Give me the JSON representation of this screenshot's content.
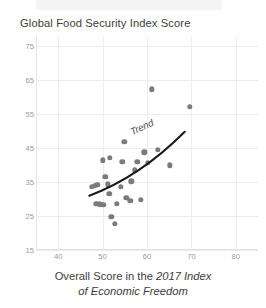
{
  "chart_data": {
    "type": "scatter",
    "title": "Global Food Security Index Score",
    "xlabel_plain": "Overall Score in the ",
    "xlabel_italic_line1": "2017 Index",
    "xlabel_italic_line2": "of Economic Freedom",
    "ylabel": "Global Food Security Index Score",
    "xlim": [
      35,
      85
    ],
    "ylim": [
      15,
      78
    ],
    "xticks": [
      40,
      50,
      60,
      70,
      80
    ],
    "yticks": [
      15,
      25,
      35,
      45,
      55,
      65,
      75
    ],
    "grid": "light",
    "legend": "none",
    "annotations": [
      {
        "text": "Trend",
        "style": "italic",
        "rotation_deg": -25
      }
    ],
    "series": [
      {
        "name": "Countries",
        "marker": "circle",
        "color": "#7b7b7b",
        "points": [
          {
            "x": 47.6,
            "y": 33.6
          },
          {
            "x": 48.3,
            "y": 33.9
          },
          {
            "x": 48.8,
            "y": 34.2
          },
          {
            "x": 48.6,
            "y": 28.6
          },
          {
            "x": 49.4,
            "y": 28.4
          },
          {
            "x": 50.2,
            "y": 28.3
          },
          {
            "x": 50.0,
            "y": 41.4
          },
          {
            "x": 50.6,
            "y": 36.5
          },
          {
            "x": 51.2,
            "y": 34.3
          },
          {
            "x": 51.6,
            "y": 42.2
          },
          {
            "x": 51.5,
            "y": 31.5
          },
          {
            "x": 52.0,
            "y": 24.7
          },
          {
            "x": 52.8,
            "y": 22.8
          },
          {
            "x": 53.2,
            "y": 28.6
          },
          {
            "x": 54.1,
            "y": 33.6
          },
          {
            "x": 54.4,
            "y": 40.9
          },
          {
            "x": 54.9,
            "y": 46.8
          },
          {
            "x": 55.3,
            "y": 30.4
          },
          {
            "x": 56.2,
            "y": 29.5
          },
          {
            "x": 56.5,
            "y": 35.2
          },
          {
            "x": 57.3,
            "y": 38.5
          },
          {
            "x": 57.8,
            "y": 41.0
          },
          {
            "x": 58.6,
            "y": 29.8
          },
          {
            "x": 59.4,
            "y": 43.8
          },
          {
            "x": 60.2,
            "y": 40.6
          },
          {
            "x": 61.1,
            "y": 62.3
          },
          {
            "x": 62.4,
            "y": 44.5
          },
          {
            "x": 65.2,
            "y": 39.9
          },
          {
            "x": 69.6,
            "y": 57.2
          }
        ]
      }
    ],
    "trend": {
      "name": "Trend",
      "type": "curve",
      "color": "#1a1a1a",
      "start": {
        "x": 47.0,
        "y": 31.0
      },
      "mid": {
        "x": 58.0,
        "y": 38.4
      },
      "end": {
        "x": 68.5,
        "y": 49.8
      }
    }
  }
}
